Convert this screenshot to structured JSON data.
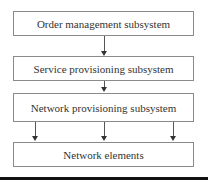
{
  "diagram": {
    "type": "flowchart",
    "boxes": [
      {
        "id": "order",
        "label": "Order management subsystem"
      },
      {
        "id": "service",
        "label": "Service provisioning subsystem"
      },
      {
        "id": "network_prov",
        "label": "Network provisioning subsystem"
      },
      {
        "id": "elements",
        "label": "Network elements"
      }
    ],
    "edges": [
      {
        "from": "order",
        "to": "service"
      },
      {
        "from": "service",
        "to": "network_prov"
      },
      {
        "from": "network_prov",
        "to": "elements",
        "count": 3
      }
    ],
    "colors": {
      "border": "#8a8a8a",
      "arrow": "#333333",
      "text": "#333333"
    }
  }
}
